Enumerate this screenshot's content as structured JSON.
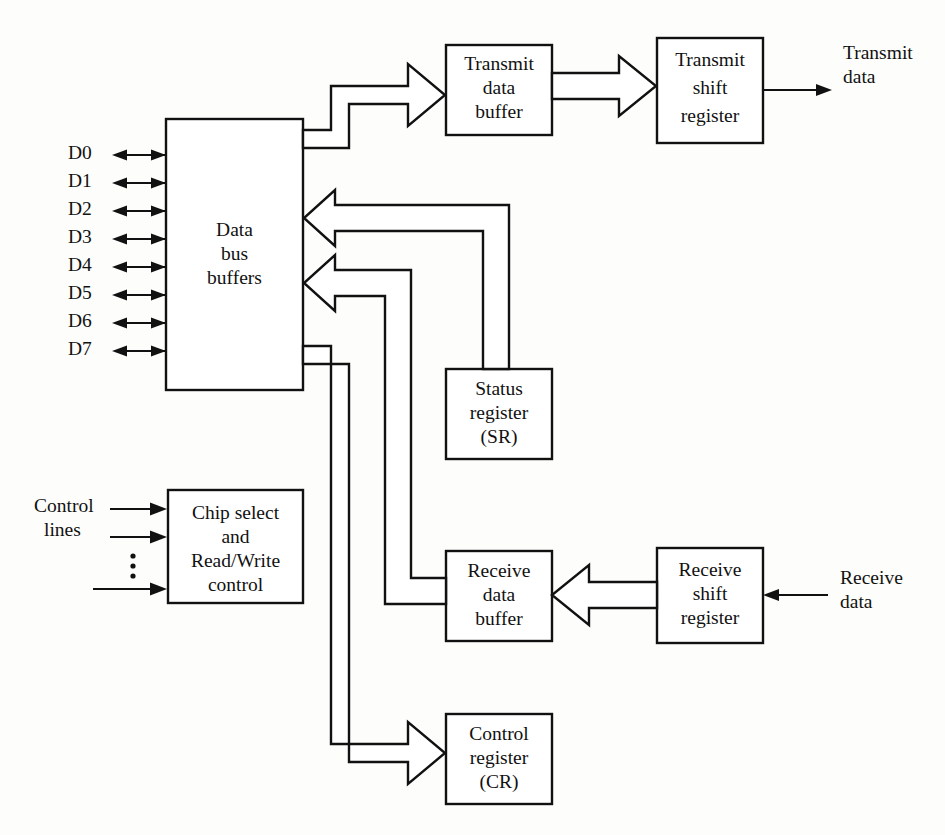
{
  "diagram": {
    "stroke_color": "#111111",
    "fill_color": "#ffffff",
    "background_color": "#fdfdfb",
    "blocks": [
      {
        "id": "data-bus-buffers",
        "lines": [
          "Data",
          "bus",
          "buffers"
        ]
      },
      {
        "id": "transmit-data-buffer",
        "lines": [
          "Transmit",
          "data",
          "buffer"
        ]
      },
      {
        "id": "transmit-shift-register",
        "lines": [
          "Transmit",
          "shift",
          "register"
        ]
      },
      {
        "id": "status-register",
        "lines": [
          "Status",
          "register",
          "(SR)"
        ]
      },
      {
        "id": "chip-select-read-write-control",
        "lines": [
          "Chip select",
          "and",
          "Read/Write",
          "control"
        ]
      },
      {
        "id": "receive-data-buffer",
        "lines": [
          "Receive",
          "data",
          "buffer"
        ]
      },
      {
        "id": "receive-shift-register",
        "lines": [
          "Receive",
          "shift",
          "register"
        ]
      },
      {
        "id": "control-register",
        "lines": [
          "Control",
          "register",
          "(CR)"
        ]
      }
    ],
    "data_bus_labels": [
      "D0",
      "D1",
      "D2",
      "D3",
      "D4",
      "D5",
      "D6",
      "D7"
    ],
    "external_labels": {
      "transmit_data": [
        "Transmit",
        "data"
      ],
      "receive_data": [
        "Receive",
        "data"
      ],
      "control_lines": [
        "Control",
        "lines"
      ]
    },
    "vertical_ellipsis": "⋮"
  }
}
